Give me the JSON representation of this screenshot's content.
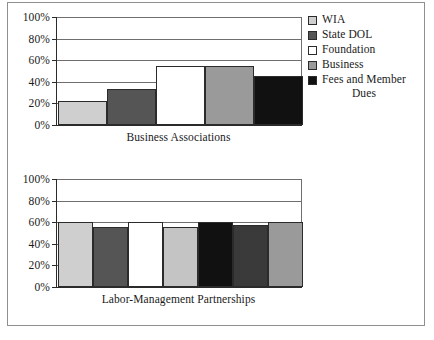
{
  "figure": {
    "frame_color": "#8f8f8f",
    "background": "#ffffff"
  },
  "palette": {
    "light_gray": "#cfcfcf",
    "dark_gray": "#555555",
    "white": "#ffffff",
    "medium_gray": "#9a9a9a",
    "black": "#111111",
    "mid_light_gray": "#c4c4c4",
    "outline": "#2b2b2b",
    "gridline": "#6e6e6e"
  },
  "chart_data": [
    {
      "type": "bar",
      "title": "",
      "xlabel": "Business Associations",
      "ylabel": "",
      "ylim": [
        0,
        100
      ],
      "yticks": [
        "0%",
        "20%",
        "40%",
        "60%",
        "80%",
        "100%"
      ],
      "grid": true,
      "legend_position": "right",
      "categories": [
        "WIA",
        "State DOL",
        "Foundation",
        "Business",
        "Fees and Member Dues"
      ],
      "values": [
        22,
        33,
        55,
        55,
        45
      ],
      "colors": [
        "#cfcfcf",
        "#555555",
        "#ffffff",
        "#9a9a9a",
        "#111111"
      ],
      "legend": [
        {
          "label": "WIA",
          "color": "#cfcfcf"
        },
        {
          "label": "State DOL",
          "color": "#555555"
        },
        {
          "label": "Foundation",
          "color": "#ffffff"
        },
        {
          "label": "Business",
          "color": "#9a9a9a"
        },
        {
          "label": "Fees and Member",
          "label_cont": "Dues",
          "color": "#111111"
        }
      ]
    },
    {
      "type": "bar",
      "title": "",
      "xlabel": "Labor-Management Partnerships",
      "ylabel": "",
      "ylim": [
        0,
        100
      ],
      "yticks": [
        "0%",
        "20%",
        "40%",
        "60%",
        "80%",
        "100%"
      ],
      "grid": true,
      "legend_position": "right",
      "categories": [
        "WIA",
        "Fee for Service",
        "Business",
        "Foundation",
        "State DOL",
        "Incumbent Worker",
        "State/County Welfare"
      ],
      "values": [
        60,
        56,
        60,
        56,
        60,
        57,
        60
      ],
      "colors": [
        "#cfcfcf",
        "#555555",
        "#ffffff",
        "#c4c4c4",
        "#111111",
        "#3a3a3a",
        "#9a9a9a"
      ],
      "legend": [
        {
          "label": "WIA",
          "color": "#cfcfcf"
        },
        {
          "label": "Fee for Service",
          "color": "#555555"
        },
        {
          "label": "Business",
          "color": "#ffffff"
        },
        {
          "label": "Foundation",
          "color": "#c4c4c4"
        },
        {
          "label": "State DOL",
          "color": "#111111"
        },
        {
          "label": "Incumbent Worker",
          "color": "#3a3a3a"
        },
        {
          "label": "State/County",
          "label_cont": "Welfare",
          "color": "#9a9a9a"
        }
      ]
    }
  ]
}
